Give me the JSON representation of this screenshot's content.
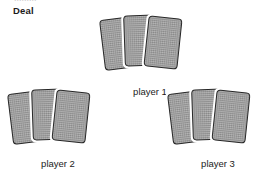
{
  "figure": {
    "title": "Deal",
    "background_color": "#ffffff",
    "width": 266,
    "height": 177,
    "top_cropped_text_remnant": "........."
  },
  "style": {
    "card_fill_color": "#9b9b9b",
    "card_outline_color": "#272727",
    "card_edge_color": "#ffffff",
    "text_color": "#1b1b1b"
  },
  "groups": [
    {
      "id": "player-1",
      "label": "player 1",
      "card_count": 3,
      "position": "top-center"
    },
    {
      "id": "player-2",
      "label": "player 2",
      "card_count": 3,
      "position": "bottom-left"
    },
    {
      "id": "player-3",
      "label": "player 3",
      "card_count": 3,
      "position": "bottom-right"
    }
  ]
}
